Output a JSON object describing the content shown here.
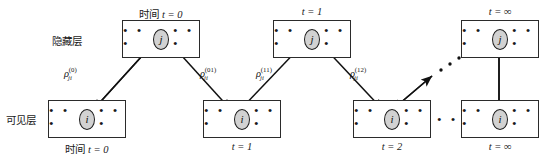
{
  "figure": {
    "colors": {
      "node_fill": "#d2d2d2",
      "stroke": "#1e1e1e",
      "box_border": "#2b2b2b",
      "background": "#ffffff"
    }
  },
  "side_labels": {
    "hidden": "隐藏层",
    "visible": "可见层"
  },
  "ellipsis": {
    "glyph": "• • •",
    "gap_visible": "• • •"
  },
  "nodes": {
    "hidden_symbol": "j",
    "visible_symbol": "i"
  },
  "columns": [
    {
      "id": "t0",
      "hidden_caption": "时间 t = 0",
      "hidden_caption_plain": "时间 ",
      "hidden_caption_math": "t = 0",
      "visible_caption_plain": "时间 ",
      "visible_caption_math": "t = 0",
      "has_hidden": true,
      "has_visible": true
    },
    {
      "id": "t1",
      "hidden_caption_plain": "",
      "hidden_caption_math": "t = 1",
      "visible_caption_plain": "",
      "visible_caption_math": "t = 1",
      "has_hidden": true,
      "has_visible": true
    },
    {
      "id": "t2",
      "hidden_caption_plain": "",
      "hidden_caption_math": "",
      "visible_caption_plain": "",
      "visible_caption_math": "t = 2",
      "has_hidden": false,
      "has_visible": true
    },
    {
      "id": "tinf",
      "hidden_caption_plain": "",
      "hidden_caption_math": "t = ∞",
      "visible_caption_plain": "",
      "visible_caption_math": "t = ∞",
      "has_hidden": true,
      "has_visible": true
    }
  ],
  "weights": [
    {
      "id": "w0",
      "symbol": "ρ",
      "sub": "ji",
      "sup": "(0)"
    },
    {
      "id": "w01",
      "symbol": "ρ",
      "sub": "ji",
      "sup": "(01)"
    },
    {
      "id": "w11",
      "symbol": "ρ",
      "sub": "ji",
      "sup": "(11)"
    },
    {
      "id": "w12",
      "symbol": "ρ",
      "sub": "ji",
      "sup": "(12)"
    }
  ]
}
